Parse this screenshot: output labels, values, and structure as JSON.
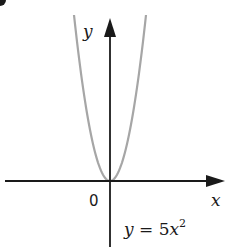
{
  "chart_data": {
    "type": "line",
    "title": "",
    "xlabel": "x",
    "ylabel": "y",
    "origin_label": "0",
    "equation_label": "y = 5x²",
    "series": [
      {
        "name": "y = 5x^2",
        "function": "5*x^2",
        "color": "#a6a6a6",
        "points": [
          {
            "x": -1.0,
            "y": 5.0
          },
          {
            "x": -0.75,
            "y": 2.8125
          },
          {
            "x": -0.5,
            "y": 1.25
          },
          {
            "x": -0.25,
            "y": 0.3125
          },
          {
            "x": 0.0,
            "y": 0.0
          },
          {
            "x": 0.25,
            "y": 0.3125
          },
          {
            "x": 0.5,
            "y": 1.25
          },
          {
            "x": 0.75,
            "y": 2.8125
          },
          {
            "x": 1.0,
            "y": 5.0
          }
        ]
      }
    ],
    "grid": false,
    "legend": "none",
    "axes_color": "#1a1a1a",
    "ticks": "none"
  },
  "labels": {
    "y_axis": "y",
    "x_axis": "x",
    "origin": "0",
    "eq_y": "y",
    "eq_mid": " = 5",
    "eq_x": "x",
    "eq_exp": "2"
  }
}
